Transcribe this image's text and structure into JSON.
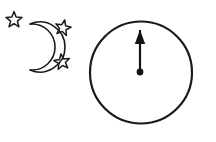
{
  "figure": {
    "background_color": "#ffffff",
    "ink_color": "#1a1a1a",
    "width": 216,
    "height": 142
  },
  "groups": [
    {
      "id": "night-sky-group",
      "label": "Crescent moon with three stars"
    },
    {
      "id": "dial-group",
      "label": "Circle containing an upward arrow with a dot at its base"
    }
  ],
  "moon": {
    "icon_name": "crescent-moon-icon",
    "label": "Crescent moon",
    "orientation": "opening-left",
    "outer_center_x": 40,
    "outer_center_y": 47,
    "outer_radius": 25,
    "inner_center_x": 28,
    "inner_center_y": 47,
    "inner_radius": 23,
    "stroke_width": 1.6
  },
  "stars": [
    {
      "icon_name": "star-outline-icon",
      "label": "Upper left star",
      "center_x": 14,
      "center_y": 20,
      "outer_radius": 8.4,
      "inner_radius": 3.6,
      "rotation_deg": 0,
      "stroke_width": 1.5
    },
    {
      "icon_name": "star-outline-icon",
      "label": "Upper right star",
      "center_x": 63,
      "center_y": 28,
      "outer_radius": 8.2,
      "inner_radius": 3.5,
      "rotation_deg": 12,
      "stroke_width": 1.5
    },
    {
      "icon_name": "star-outline-icon",
      "label": "Lower right star",
      "center_x": 62,
      "center_y": 62,
      "outer_radius": 8.2,
      "inner_radius": 3.5,
      "rotation_deg": -8,
      "stroke_width": 1.5
    }
  ],
  "circle": {
    "icon_name": "circle-outline-icon",
    "label": "Large outline circle",
    "center_x": 141,
    "center_y": 72.5,
    "radius": 51,
    "stroke_width": 2.2
  },
  "arrow": {
    "icon_name": "up-arrow-icon",
    "label": "Upward arrow inside the circle",
    "direction": "up",
    "axis_x": 140,
    "tip_y": 30,
    "head_base_y": 44,
    "head_half_width": 5.2,
    "shaft_bottom_y": 71,
    "shaft_width": 2.2,
    "dot_center_x": 140,
    "dot_center_y": 72,
    "dot_radius": 3.4
  }
}
